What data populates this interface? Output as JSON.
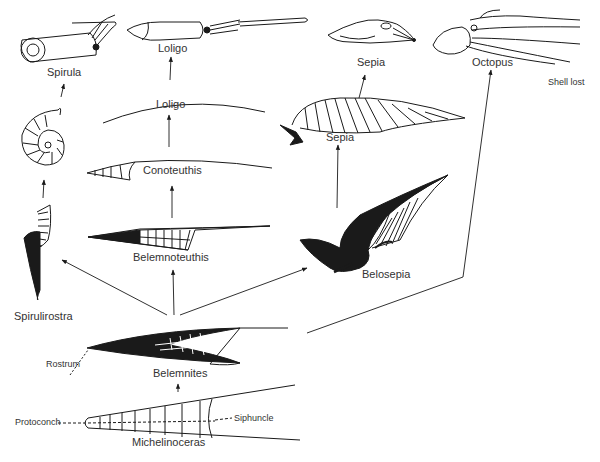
{
  "diagram": {
    "type": "evolutionary-tree",
    "colors": {
      "ink": "#1a1a1a",
      "background": "#ffffff",
      "label": "#333333"
    },
    "nodes": {
      "spirula_animal": "Spirula",
      "loligo_animal": "Loligo",
      "sepia_animal": "Sepia",
      "octopus_animal": "Octopus",
      "shell_lost": "Shell lost",
      "loligo_shell": "Loligo",
      "conoteuthis": "Conoteuthis",
      "sepia_shell": "Sepia",
      "belemnoteuthis": "Belemnoteuthis",
      "belosepia": "Belosepia",
      "spirulirostra": "Spirulirostra",
      "belemnites": "Belemnites",
      "michelinoceras": "Michelinoceras"
    },
    "annotations": {
      "rostrum": "Rostrum",
      "protoconch": "Protoconch",
      "siphuncle": "Siphuncle"
    },
    "edges": [
      [
        "Michelinoceras",
        "Belemnites"
      ],
      [
        "Belemnites",
        "Spirulirostra"
      ],
      [
        "Belemnites",
        "Belemnoteuthis"
      ],
      [
        "Belemnites",
        "Belosepia"
      ],
      [
        "Belemnites",
        "Octopus"
      ],
      [
        "Spirulirostra",
        "Spirula shell"
      ],
      [
        "Spirula shell",
        "Spirula"
      ],
      [
        "Belemnoteuthis",
        "Conoteuthis"
      ],
      [
        "Conoteuthis",
        "Loligo shell"
      ],
      [
        "Loligo shell",
        "Loligo"
      ],
      [
        "Belosepia",
        "Sepia shell"
      ],
      [
        "Sepia shell",
        "Sepia"
      ]
    ]
  }
}
